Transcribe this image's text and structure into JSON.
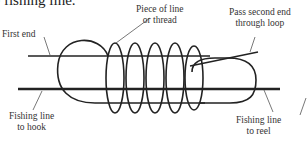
{
  "caption_fragment": "he fishing line.",
  "labels": {
    "first_end": "First end",
    "piece_of_line_1": "Piece of line",
    "piece_of_line_2": "or thread",
    "pass_second_end_1": "Pass second end",
    "pass_second_end_2": "through loop",
    "line_to_hook_1": "Fishing line",
    "line_to_hook_2": "to hook",
    "line_to_reel_1": "Fishing line",
    "line_to_reel_2": "to reel"
  },
  "colors": {
    "line": "#222222",
    "leader": "#555555",
    "background": "#ffffff"
  }
}
